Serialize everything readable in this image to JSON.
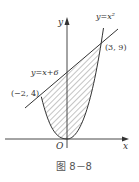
{
  "figure": {
    "caption": "图 8－8",
    "axes": {
      "x_label": "x",
      "y_label": "y",
      "origin_label": "O"
    },
    "curves": [
      {
        "name": "parabola",
        "label": "y=x²"
      },
      {
        "name": "line",
        "label": "y=x+6"
      }
    ],
    "points": [
      {
        "name": "left-intersection",
        "label": "(−2, 4)"
      },
      {
        "name": "right-intersection",
        "label": "(3, 9)"
      }
    ],
    "shaded_region": "area between y=x+6 and y=x² for −2 ≤ x ≤ 3",
    "colors": {
      "stroke": "#333333",
      "hatch": "#555555",
      "background": "#ffffff"
    }
  }
}
